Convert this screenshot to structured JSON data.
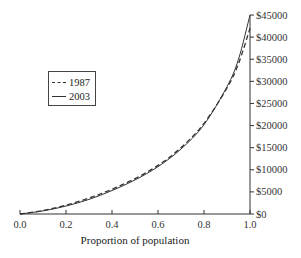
{
  "chart_data": {
    "type": "line",
    "title": "",
    "xlabel": "Proportion of population",
    "ylabel": "",
    "xlim": [
      0.0,
      1.0
    ],
    "ylim": [
      0,
      45000
    ],
    "x_ticks": [
      "0.0",
      "0.2",
      "0.4",
      "0.6",
      "0.8",
      "1.0"
    ],
    "y_ticks": [
      "$0",
      "$5000",
      "$10000",
      "$15000",
      "$20000",
      "$25000",
      "$30000",
      "$35000",
      "$40000",
      "$45000"
    ],
    "y_axis_position": "right",
    "grid": false,
    "legend_position": "upper-left",
    "x": [
      0.0,
      0.1,
      0.2,
      0.3,
      0.4,
      0.5,
      0.6,
      0.7,
      0.8,
      0.9,
      0.95,
      1.0
    ],
    "series": [
      {
        "name": "1987",
        "style": "dashed",
        "values": [
          0,
          800,
          2000,
          3600,
          5600,
          8000,
          11000,
          15000,
          20500,
          28500,
          34000,
          42000
        ]
      },
      {
        "name": "2003",
        "style": "solid",
        "values": [
          0,
          700,
          1800,
          3300,
          5300,
          7700,
          10700,
          14700,
          20200,
          28800,
          35000,
          45000
        ]
      }
    ]
  },
  "legend": {
    "items": [
      {
        "label": "1987",
        "style": "dashed"
      },
      {
        "label": "2003",
        "style": "solid"
      }
    ]
  }
}
